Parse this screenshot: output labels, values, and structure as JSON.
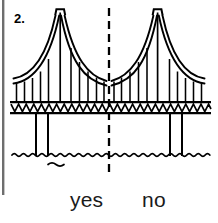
{
  "page": {
    "width": 218,
    "height": 223,
    "background_color": "#ffffff",
    "ink_color": "#000000",
    "border_color": "#6e6e6e"
  },
  "question": {
    "number_label": "2.",
    "prompt_type": "symmetry-check",
    "answers": [
      {
        "key": "yes",
        "label": "yes"
      },
      {
        "key": "no",
        "label": "no"
      }
    ]
  },
  "figure": {
    "name": "suspension-bridge",
    "symmetry_line": {
      "orientation": "vertical",
      "x": 109,
      "y_start": 8,
      "y_end": 172,
      "style": "dashed",
      "dash_length": 8,
      "dash_gap": 5,
      "stroke_width": 2.2
    },
    "towers": [
      {
        "name": "left-tower",
        "x": 60,
        "cap_top_y": 9,
        "cap_bottom_y": 15,
        "cap_half_width": 5,
        "base_y": 103
      },
      {
        "name": "right-tower",
        "x": 155,
        "cap_top_y": 9,
        "cap_bottom_y": 15,
        "cap_half_width": 5,
        "base_y": 103
      }
    ],
    "main_cable": {
      "style": "double-line",
      "line_gap": 4,
      "left_anchor": {
        "x": 14,
        "y": 80
      },
      "right_anchor": {
        "x": 205,
        "y": 80
      },
      "center_low": {
        "x": 109,
        "y": 84
      },
      "stroke_width": 1.8
    },
    "suspenders": {
      "count": 20,
      "deck_y": 102,
      "stroke_width": 1.6
    },
    "deck": {
      "top_line_y": 102,
      "bottom_line_y": 113,
      "x_start": 10,
      "x_end": 211,
      "stroke_width": 2.2,
      "truss_pattern": "zigzag-triangles",
      "truss_top_y": 104,
      "truss_bottom_y": 112,
      "truss_segments": 26
    },
    "piers": [
      {
        "name": "pier-1",
        "x": 36
      },
      {
        "name": "pier-2",
        "x": 48
      },
      {
        "name": "pier-3",
        "x": 172
      },
      {
        "name": "pier-4",
        "x": 184
      }
    ],
    "pier_top_y": 113,
    "pier_bottom_y": 156,
    "water": {
      "name": "water-line",
      "y": 155,
      "x_start": 12,
      "x_end": 210,
      "wave_amplitude": 2.2,
      "wave_period": 9,
      "stroke_width": 1.8
    },
    "water_ripple": {
      "name": "small-wave",
      "x": 48,
      "y": 164,
      "width": 16
    }
  },
  "left_border": {
    "x": 3,
    "y_start": 0,
    "y_end": 195,
    "stroke_width": 2.4
  }
}
